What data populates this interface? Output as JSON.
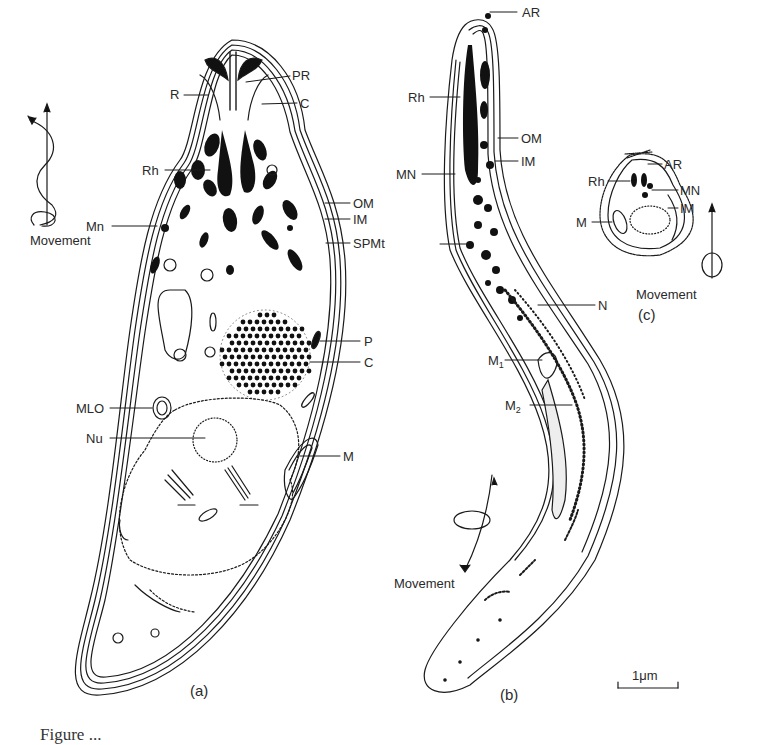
{
  "figure": {
    "panels": [
      {
        "id": "a",
        "panel_label": "(a)",
        "movement_label": "Movement",
        "labels": {
          "PR": "PR",
          "R": "R",
          "C_top": "C",
          "Rh": "Rh",
          "Mn": "Mn",
          "OM": "OM",
          "IM": "IM",
          "SPMt": "SPMt",
          "P": "P",
          "C_mid": "C",
          "MLO": "MLO",
          "Nu": "Nu",
          "M": "M"
        }
      },
      {
        "id": "b",
        "panel_label": "(b)",
        "movement_label": "Movement",
        "labels": {
          "AR": "AR",
          "Rh": "Rh",
          "OM": "OM",
          "IM": "IM",
          "MN": "MN",
          "N": "N",
          "M1": "M",
          "M1_sub": "1",
          "M2": "M",
          "M2_sub": "2"
        }
      },
      {
        "id": "c",
        "panel_label": "(c)",
        "movement_label": "Movement",
        "labels": {
          "AR": "AR",
          "Rh": "Rh",
          "MN": "MN",
          "IM": "IM",
          "M": "M"
        }
      }
    ],
    "scale_bar": {
      "label": "1 μm",
      "label_text": "1μm"
    },
    "caption_partial": "Figure ..."
  },
  "colors": {
    "ink": "#1a1a1a",
    "paper": "#ffffff"
  }
}
